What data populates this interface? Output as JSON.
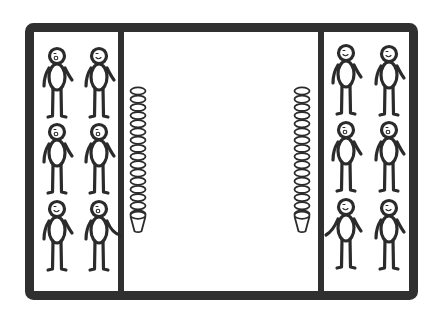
{
  "illustration": {
    "description": "Two teams of stick figures standing in end zones of a rectangular court, each facing a tall stack of cups",
    "colors": {
      "background": "#ffffff",
      "line": "#2b2b2b",
      "frame": "#303030"
    },
    "frame": {
      "x": 25,
      "y": 23,
      "width": 393,
      "height": 277,
      "stroke": 9,
      "corner_radius": 4
    },
    "dividers": [
      {
        "name": "left-divider",
        "x": 121,
        "stroke": 6
      },
      {
        "name": "right-divider",
        "x": 321,
        "stroke": 6
      }
    ],
    "teams": [
      {
        "name": "left-team",
        "figures": [
          {
            "cx": 57,
            "top": 48,
            "face": "open-mouth",
            "arm": "none"
          },
          {
            "cx": 99,
            "top": 48,
            "face": "smile",
            "arm": "none"
          },
          {
            "cx": 57,
            "top": 124,
            "face": "open-mouth",
            "arm": "none"
          },
          {
            "cx": 99,
            "top": 124,
            "face": "open-mouth",
            "arm": "none"
          },
          {
            "cx": 57,
            "top": 201,
            "face": "smile",
            "arm": "none"
          },
          {
            "cx": 99,
            "top": 201,
            "face": "open-mouth",
            "arm": "reach-right"
          }
        ]
      },
      {
        "name": "right-team",
        "figures": [
          {
            "cx": 346,
            "top": 45,
            "face": "smile",
            "arm": "none"
          },
          {
            "cx": 389,
            "top": 46,
            "face": "smile",
            "arm": "none"
          },
          {
            "cx": 346,
            "top": 122,
            "face": "open-mouth",
            "arm": "none"
          },
          {
            "cx": 389,
            "top": 122,
            "face": "open-mouth",
            "arm": "none"
          },
          {
            "cx": 346,
            "top": 199,
            "face": "smile",
            "arm": "reach-left"
          },
          {
            "cx": 389,
            "top": 200,
            "face": "smile",
            "arm": "none"
          }
        ]
      }
    ],
    "cup_stacks": [
      {
        "name": "left-cup-stack",
        "cx": 138,
        "top": 87,
        "rim_count": 16,
        "width": 16
      },
      {
        "name": "right-cup-stack",
        "cx": 302,
        "top": 87,
        "rim_count": 16,
        "width": 16
      }
    ]
  }
}
